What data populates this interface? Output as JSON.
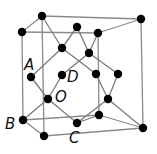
{
  "colors": {
    "edge": "#8a8a8a",
    "bond": "#7a7a7a",
    "atom": "#000000",
    "label": "#111111"
  },
  "atoms": [
    {
      "id": "K1",
      "x": 42,
      "y": 16
    },
    {
      "id": "K2",
      "x": 141,
      "y": 19
    },
    {
      "id": "F1",
      "x": 22,
      "y": 32
    },
    {
      "id": "T1",
      "x": 77,
      "y": 27
    },
    {
      "id": "F2",
      "x": 98,
      "y": 33
    },
    {
      "id": "M1",
      "x": 62,
      "y": 48
    },
    {
      "id": "M2",
      "x": 89,
      "y": 53
    },
    {
      "id": "A",
      "x": 31,
      "y": 77
    },
    {
      "id": "D",
      "x": 62,
      "y": 75
    },
    {
      "id": "R1",
      "x": 96,
      "y": 74
    },
    {
      "id": "R2",
      "x": 118,
      "y": 74
    },
    {
      "id": "O",
      "x": 48,
      "y": 99
    },
    {
      "id": "R3",
      "x": 108,
      "y": 99
    },
    {
      "id": "F3",
      "x": 99,
      "y": 115
    },
    {
      "id": "B",
      "x": 23,
      "y": 120
    },
    {
      "id": "C",
      "x": 77,
      "y": 123
    },
    {
      "id": "K3",
      "x": 143,
      "y": 128
    },
    {
      "id": "K4",
      "x": 44,
      "y": 136
    }
  ],
  "cube_edges": [
    [
      "F1",
      "F2"
    ],
    [
      "K1",
      "K2"
    ],
    [
      "F1",
      "K1"
    ],
    [
      "F2",
      "K2"
    ],
    [
      "F1",
      "B"
    ],
    [
      "F2",
      "F3"
    ],
    [
      "K1",
      "K4"
    ],
    [
      "K2",
      "K3"
    ],
    [
      "B",
      "F3"
    ],
    [
      "K4",
      "K3"
    ],
    [
      "B",
      "K4"
    ],
    [
      "F3",
      "K3"
    ]
  ],
  "bonds": [
    [
      "K1",
      "M1"
    ],
    [
      "T1",
      "M1"
    ],
    [
      "T1",
      "M2"
    ],
    [
      "F2",
      "M2"
    ],
    [
      "M1",
      "A"
    ],
    [
      "M1",
      "R1"
    ],
    [
      "M2",
      "D"
    ],
    [
      "M2",
      "R2"
    ],
    [
      "A",
      "O"
    ],
    [
      "D",
      "O"
    ],
    [
      "O",
      "B"
    ],
    [
      "O",
      "C"
    ],
    [
      "R1",
      "R3"
    ],
    [
      "R2",
      "R3"
    ],
    [
      "R3",
      "C"
    ],
    [
      "R3",
      "K3"
    ],
    [
      "C",
      "F3"
    ]
  ],
  "labels": [
    {
      "text": "A",
      "x": 24,
      "y": 58
    },
    {
      "text": "D",
      "x": 67,
      "y": 70
    },
    {
      "text": "O",
      "x": 55,
      "y": 90
    },
    {
      "text": "B",
      "x": 5,
      "y": 117
    },
    {
      "text": "C",
      "x": 69,
      "y": 131
    }
  ]
}
